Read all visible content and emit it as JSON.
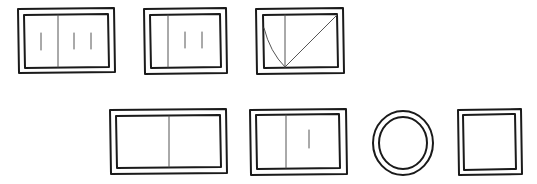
{
  "diagram": {
    "colors": {
      "ink": "#1a1a1a",
      "inner_line": "#555555",
      "background": "#ffffff"
    },
    "rows": [
      {
        "shapes": [
          {
            "id": "panel-1",
            "type": "double-rect",
            "divider": "vertical-center",
            "tally_marks": {
              "left": 1,
              "right": 2
            }
          },
          {
            "id": "panel-2",
            "type": "double-rect",
            "divider": "vertical-left",
            "tally_marks": {
              "left": 0,
              "right": 2
            }
          },
          {
            "id": "panel-3",
            "type": "double-rect",
            "divider": "vertical-left",
            "curves": [
              "left-arc-to-bottom",
              "diagonal-to-top-right"
            ]
          }
        ]
      },
      {
        "shapes": [
          {
            "id": "panel-4",
            "type": "double-rect",
            "divider": "vertical-center",
            "tally_marks": {
              "left": 0,
              "right": 0
            }
          },
          {
            "id": "panel-5",
            "type": "double-rect",
            "divider": "vertical-left",
            "tally_marks": {
              "left": 0,
              "right": 1
            }
          },
          {
            "id": "circle-6",
            "type": "double-circle"
          },
          {
            "id": "square-7",
            "type": "double-square"
          }
        ]
      }
    ]
  }
}
